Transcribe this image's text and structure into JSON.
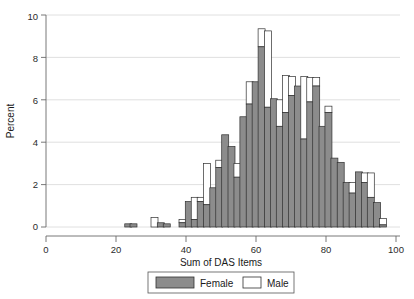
{
  "chart_data": {
    "type": "bar",
    "title": "",
    "subtitle": "",
    "xlabel": "Sum of DAS Items",
    "ylabel": "Percent",
    "xlim": [
      0,
      100
    ],
    "ylim": [
      0,
      10
    ],
    "xticks": [
      0,
      20,
      40,
      60,
      80,
      100
    ],
    "yticks": [
      0,
      2,
      4,
      6,
      8,
      10
    ],
    "xtick_labels": [
      "0",
      "20",
      "40",
      "60",
      "80",
      "100"
    ],
    "ytick_labels": [
      "0",
      "2",
      "4",
      "6",
      "8",
      "10"
    ],
    "grid": "horizontal",
    "stacked": true,
    "bin_width": 2,
    "legend_position": "bottom-center",
    "legend": [
      {
        "name": "Female",
        "color": "#8c8c8c",
        "swatch": "filled-gray"
      },
      {
        "name": "Male",
        "color": "#ffffff",
        "swatch": "outline-white"
      }
    ],
    "series": [
      {
        "name": "Female",
        "values": [
          0,
          0,
          0,
          0,
          0,
          0,
          0,
          0,
          0,
          0,
          0,
          0.15,
          0,
          0,
          0,
          0.15,
          0,
          0,
          0,
          0,
          0.2,
          0.15,
          0,
          0,
          0.2,
          1.2,
          0.35,
          1.2,
          1.05,
          1.85,
          2.8,
          4.35,
          3.8,
          2.35,
          5.2,
          5.8,
          6.85,
          8.5,
          5.65,
          6.05,
          4.75,
          5.4,
          6.2,
          6.65,
          4.15,
          5.9,
          6.65,
          4.75,
          5.4,
          3.25,
          3.05,
          2.1,
          1.6,
          2.6,
          2.1,
          1.4,
          1.15,
          0.1
        ]
      },
      {
        "name": "Male",
        "values": [
          0,
          0,
          0,
          0,
          0,
          0,
          0,
          0,
          0,
          0,
          0,
          0,
          0,
          0,
          0,
          0,
          0,
          0,
          0,
          0.45,
          0.2,
          0,
          0,
          0,
          0.15,
          0,
          1.05,
          0.2,
          0.45,
          1.15,
          0,
          0,
          0,
          0.65,
          0,
          1.05,
          0,
          0.85,
          3.6,
          0,
          1.25,
          1.75,
          0.9,
          0,
          2.95,
          1.15,
          0.4,
          0,
          0.3,
          0,
          0,
          0,
          0.5,
          0,
          0.45,
          1.15,
          0,
          0.3
        ]
      }
    ],
    "x": [
      22,
      24,
      26,
      28,
      30,
      32,
      34,
      36,
      38,
      40,
      42,
      23,
      25,
      27,
      29,
      24.5,
      31,
      33,
      35,
      31,
      33,
      35,
      37,
      38,
      39,
      41,
      42,
      43,
      44,
      45,
      47,
      49,
      50,
      51,
      53,
      55,
      56,
      57,
      58,
      59,
      61,
      62,
      63,
      65,
      66,
      67,
      69,
      70,
      71,
      73,
      75,
      77,
      79,
      81,
      83,
      85,
      87,
      89
    ],
    "bins": [
      {
        "center": 23.5,
        "female": 0.15,
        "male": 0
      },
      {
        "center": 25.0,
        "female": 0.15,
        "male": 0
      },
      {
        "center": 31.0,
        "female": 0.0,
        "male": 0.45
      },
      {
        "center": 32.8,
        "female": 0.2,
        "male": 0
      },
      {
        "center": 34.5,
        "female": 0.15,
        "male": 0
      },
      {
        "center": 39.0,
        "female": 0.2,
        "male": 0.15
      },
      {
        "center": 40.8,
        "female": 1.2,
        "male": 0
      },
      {
        "center": 42.5,
        "female": 0.35,
        "male": 1.05
      },
      {
        "center": 44.2,
        "female": 1.2,
        "male": 0.2
      },
      {
        "center": 46.0,
        "female": 1.05,
        "male": 1.95
      },
      {
        "center": 47.8,
        "female": 1.85,
        "male": 0
      },
      {
        "center": 49.5,
        "female": 2.8,
        "male": 0.35
      },
      {
        "center": 51.2,
        "female": 4.35,
        "male": 0
      },
      {
        "center": 53.0,
        "female": 3.8,
        "male": 0
      },
      {
        "center": 54.7,
        "female": 2.35,
        "male": 0.65
      },
      {
        "center": 56.4,
        "female": 5.2,
        "male": 0
      },
      {
        "center": 58.2,
        "female": 5.8,
        "male": 1.05
      },
      {
        "center": 59.9,
        "female": 6.85,
        "male": 0
      },
      {
        "center": 61.6,
        "female": 8.5,
        "male": 0.85
      },
      {
        "center": 63.4,
        "female": 5.65,
        "male": 3.6
      },
      {
        "center": 65.1,
        "female": 6.05,
        "male": 0
      },
      {
        "center": 66.8,
        "female": 4.75,
        "male": 1.25
      },
      {
        "center": 68.6,
        "female": 5.4,
        "male": 1.75
      },
      {
        "center": 70.3,
        "female": 6.2,
        "male": 0.9
      },
      {
        "center": 72.0,
        "female": 6.65,
        "male": 0
      },
      {
        "center": 73.8,
        "female": 4.15,
        "male": 2.95
      },
      {
        "center": 75.5,
        "female": 5.9,
        "male": 1.15
      },
      {
        "center": 77.2,
        "female": 6.65,
        "male": 0.4
      },
      {
        "center": 79.0,
        "female": 4.75,
        "male": 0
      },
      {
        "center": 80.7,
        "female": 5.4,
        "male": 0.3
      },
      {
        "center": 82.4,
        "female": 3.25,
        "male": 0
      },
      {
        "center": 84.2,
        "female": 3.05,
        "male": 0
      },
      {
        "center": 85.9,
        "female": 2.1,
        "male": 0
      },
      {
        "center": 87.6,
        "female": 1.6,
        "male": 0.5
      },
      {
        "center": 89.4,
        "female": 2.6,
        "male": 0
      },
      {
        "center": 91.1,
        "female": 2.1,
        "male": 0.45
      },
      {
        "center": 92.8,
        "female": 1.4,
        "male": 1.15
      },
      {
        "center": 94.6,
        "female": 1.15,
        "male": 0
      },
      {
        "center": 96.3,
        "female": 0.1,
        "male": 0.3
      }
    ]
  },
  "axes": {
    "x_title": "Sum of DAS Items",
    "y_title": "Percent",
    "x_tick_0": "0",
    "x_tick_1": "20",
    "x_tick_2": "40",
    "x_tick_3": "60",
    "x_tick_4": "80",
    "x_tick_5": "100",
    "y_tick_0": "0",
    "y_tick_1": "2",
    "y_tick_2": "4",
    "y_tick_3": "6",
    "y_tick_4": "8",
    "y_tick_5": "10"
  },
  "legend": {
    "female_label": "Female",
    "male_label": "Male"
  },
  "colors": {
    "female_fill": "#8c8c8c",
    "male_fill": "#ffffff",
    "bar_outline": "#303030",
    "grid": "#d8d8d8",
    "axis": "#6a6a6a",
    "background": "#ffffff"
  }
}
